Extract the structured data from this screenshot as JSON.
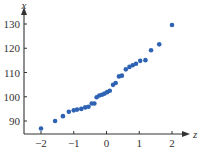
{
  "chart_data": {
    "type": "scatter",
    "title": "",
    "xlabel": "z",
    "ylabel": "x",
    "xlim": [
      -2.5,
      2.5
    ],
    "ylim": [
      84,
      132
    ],
    "xticks": [
      -2,
      -1,
      0,
      1,
      2
    ],
    "xtick_labels": [
      "−2",
      "−1",
      "0",
      "1",
      "2"
    ],
    "yticks": [
      90,
      100,
      110,
      120,
      130
    ],
    "ytick_labels": [
      "90",
      "100",
      "110",
      "120",
      "130"
    ],
    "grid": false,
    "legend": null,
    "point_color": "#2e63b4",
    "axis_color": "#333333",
    "points": [
      {
        "z": -2.0,
        "x": 86.9
      },
      {
        "z": -1.57,
        "x": 90.0
      },
      {
        "z": -1.33,
        "x": 92.0
      },
      {
        "z": -1.15,
        "x": 93.8
      },
      {
        "z": -1.0,
        "x": 94.4
      },
      {
        "z": -0.9,
        "x": 94.7
      },
      {
        "z": -0.77,
        "x": 95.0
      },
      {
        "z": -0.65,
        "x": 95.6
      },
      {
        "z": -0.55,
        "x": 95.9
      },
      {
        "z": -0.45,
        "x": 97.2
      },
      {
        "z": -0.37,
        "x": 97.2
      },
      {
        "z": -0.3,
        "x": 99.8
      },
      {
        "z": -0.22,
        "x": 100.5
      },
      {
        "z": -0.14,
        "x": 100.8
      },
      {
        "z": -0.06,
        "x": 101.3
      },
      {
        "z": 0.02,
        "x": 101.9
      },
      {
        "z": 0.1,
        "x": 102.5
      },
      {
        "z": 0.2,
        "x": 104.9
      },
      {
        "z": 0.28,
        "x": 105.7
      },
      {
        "z": 0.38,
        "x": 108.4
      },
      {
        "z": 0.47,
        "x": 108.7
      },
      {
        "z": 0.59,
        "x": 111.3
      },
      {
        "z": 0.7,
        "x": 112.3
      },
      {
        "z": 0.8,
        "x": 113.0
      },
      {
        "z": 0.9,
        "x": 113.6
      },
      {
        "z": 1.03,
        "x": 114.8
      },
      {
        "z": 1.19,
        "x": 115.1
      },
      {
        "z": 1.36,
        "x": 119.2
      },
      {
        "z": 1.61,
        "x": 121.6
      },
      {
        "z": 2.0,
        "x": 129.6
      }
    ]
  }
}
